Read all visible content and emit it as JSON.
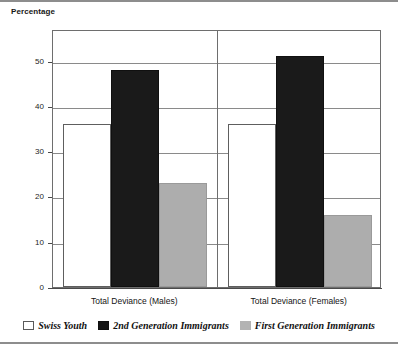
{
  "chart_data": {
    "type": "bar",
    "title": "",
    "subtitle": "",
    "xlabel": "",
    "ylabel": "Percentage",
    "ylim": [
      0,
      57
    ],
    "yticks": [
      0,
      10,
      20,
      30,
      40,
      50
    ],
    "ytick_labels": [
      "0",
      "10",
      "20",
      "30",
      "40",
      "50"
    ],
    "grid": true,
    "grid_axis": "y",
    "legend_position": "bottom",
    "categories": [
      "Total Deviance (Males)",
      "Total Deviance (Females)"
    ],
    "series": [
      {
        "name": "Swiss Youth",
        "color": "#ffffff",
        "values": [
          36,
          36
        ]
      },
      {
        "name": "2nd Generation Immigrants",
        "color": "#1a1a1a",
        "values": [
          48,
          51
        ]
      },
      {
        "name": "First Generation Immigrants",
        "color": "#adadad",
        "values": [
          23,
          16
        ]
      }
    ]
  },
  "axis": {
    "y_title": "Percentage"
  }
}
